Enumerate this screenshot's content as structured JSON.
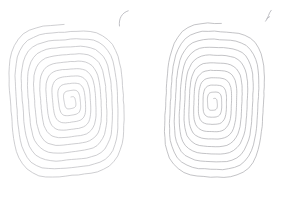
{
  "canvas": {
    "width": 285,
    "height": 200,
    "background_color": "#ffffff",
    "title": "Hand-drawn concentric spirals"
  },
  "ink": {
    "primary_color": "#b9b9bd",
    "secondary_color": "#a9a9ae",
    "mark_color": "#b0b0b6",
    "stroke_width": 0.7,
    "mark_stroke_width": 0.8
  },
  "drawings": [
    {
      "id": "left-spiral",
      "label": "left spiral drawing",
      "shape": "oval rounded-rectangle spiral",
      "center_x": 70,
      "center_y": 103,
      "turns": 10,
      "outer_width": 118,
      "outer_height": 156,
      "bounds": {
        "x": 10,
        "y": 25,
        "width": 120,
        "height": 158
      },
      "rotation_deg": -3,
      "squareness": 0.62
    },
    {
      "id": "right-spiral",
      "label": "right spiral drawing",
      "shape": "narrow teardrop angular spiral",
      "center_x": 215,
      "center_y": 101,
      "turns": 10,
      "outer_width": 104,
      "outer_height": 156,
      "bounds": {
        "x": 163,
        "y": 23,
        "width": 106,
        "height": 158
      },
      "rotation_deg": 4,
      "squareness": 0.52
    }
  ],
  "marks": [
    {
      "id": "left-stray-mark",
      "label": "small curved pen mark above left spiral",
      "x": 118,
      "y": 10,
      "width": 12,
      "height": 16
    },
    {
      "id": "right-stray-mark",
      "label": "small slanted pen mark above right spiral",
      "x": 264,
      "y": 10,
      "width": 9,
      "height": 14
    }
  ]
}
